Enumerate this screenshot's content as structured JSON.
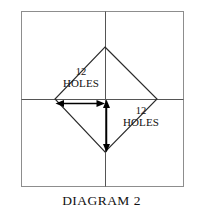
{
  "figure": {
    "caption": "DIAGRAM 2",
    "colors": {
      "background": "#ffffff",
      "outer_square_stroke": "#8d8d8d",
      "center_lines_stroke": "#555555",
      "diamond_stroke": "#2b2b2b",
      "arrow_stroke": "#000000",
      "text": "#111111"
    },
    "outer_square": {
      "name": "outer-square",
      "x": 21,
      "y": 11,
      "width": 162,
      "height": 175
    },
    "center_lines": {
      "horizontal_y": 99,
      "vertical_x": 105
    },
    "diamond": {
      "name": "inscribed-diamond",
      "vertices": {
        "top": [
          105,
          47
        ],
        "right": [
          157,
          99
        ],
        "bottom": [
          105,
          152
        ],
        "left": [
          55,
          99
        ]
      }
    },
    "dimensions": [
      {
        "name": "horizontal-dimension",
        "orientation": "horizontal",
        "number": "12",
        "unit": "HOLES",
        "from": [
          57,
          103
        ],
        "to": [
          104,
          103
        ]
      },
      {
        "name": "vertical-dimension",
        "orientation": "vertical",
        "number": "12",
        "unit": "HOLES",
        "from": [
          106,
          100
        ],
        "to": [
          106,
          151
        ]
      }
    ]
  }
}
